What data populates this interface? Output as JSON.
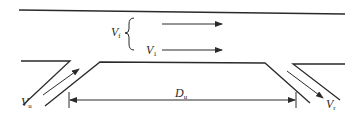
{
  "diagram": {
    "type": "freeway weaving segment",
    "colors": {
      "line": "#2a2a2a",
      "background": "#ffffff"
    },
    "labels": {
      "freeway_flow": {
        "main": "V",
        "sub": "f"
      },
      "lane1_flow": {
        "main": "V",
        "sub": "1"
      },
      "onramp_flow": {
        "main": "V",
        "sub": "u"
      },
      "offramp_flow": {
        "main": "V",
        "sub": "r"
      },
      "weaving_length": {
        "main": "D",
        "sub": "u"
      }
    },
    "arrows": [
      {
        "name": "freeway-upper-flow",
        "direction": "right"
      },
      {
        "name": "lane1-flow",
        "direction": "right"
      },
      {
        "name": "onramp-flow",
        "direction": "up-right"
      },
      {
        "name": "offramp-flow",
        "direction": "down-right"
      },
      {
        "name": "weaving-length-dimension",
        "direction": "both"
      }
    ]
  }
}
